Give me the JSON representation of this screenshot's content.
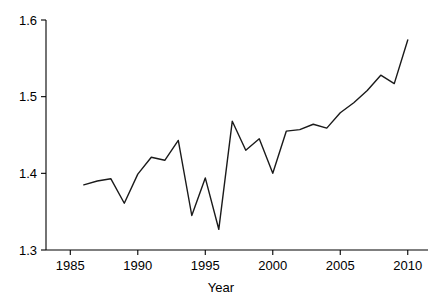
{
  "chart_data": {
    "type": "line",
    "title": "",
    "subtitle": "",
    "xlabel": "Year",
    "ylabel": "",
    "xlim": [
      1983.2,
      2011.5
    ],
    "ylim": [
      1.3,
      1.6
    ],
    "grid": false,
    "legend": null,
    "legend_position": "none",
    "line_color": "#1a1a1a",
    "background_color": "#ffffff",
    "axis_color": "#000000",
    "x_ticks": [
      1985,
      1990,
      1995,
      2000,
      2005,
      2010
    ],
    "x_tick_labels": [
      "1985",
      "1990",
      "1995",
      "2000",
      "2005",
      "2010"
    ],
    "y_ticks": [
      1.3,
      1.4,
      1.5,
      1.6
    ],
    "y_tick_labels": [
      "1.3",
      "1.4",
      "1.5",
      "1.6"
    ],
    "x": [
      1986,
      1987,
      1988,
      1989,
      1990,
      1991,
      1992,
      1993,
      1994,
      1995,
      1996,
      1997,
      1998,
      1999,
      2000,
      2001,
      2002,
      2003,
      2004,
      2005,
      2006,
      2007,
      2008,
      2009,
      2010
    ],
    "values": [
      1.385,
      1.39,
      1.393,
      1.361,
      1.399,
      1.421,
      1.417,
      1.443,
      1.345,
      1.394,
      1.327,
      1.468,
      1.43,
      1.445,
      1.4,
      1.455,
      1.457,
      1.464,
      1.459,
      1.479,
      1.492,
      1.508,
      1.528,
      1.517,
      1.574
    ],
    "series": [
      {
        "name": "value",
        "values": [
          1.385,
          1.39,
          1.393,
          1.361,
          1.399,
          1.421,
          1.417,
          1.443,
          1.345,
          1.394,
          1.327,
          1.468,
          1.43,
          1.445,
          1.4,
          1.455,
          1.457,
          1.464,
          1.459,
          1.479,
          1.492,
          1.508,
          1.528,
          1.517,
          1.574
        ]
      }
    ]
  }
}
